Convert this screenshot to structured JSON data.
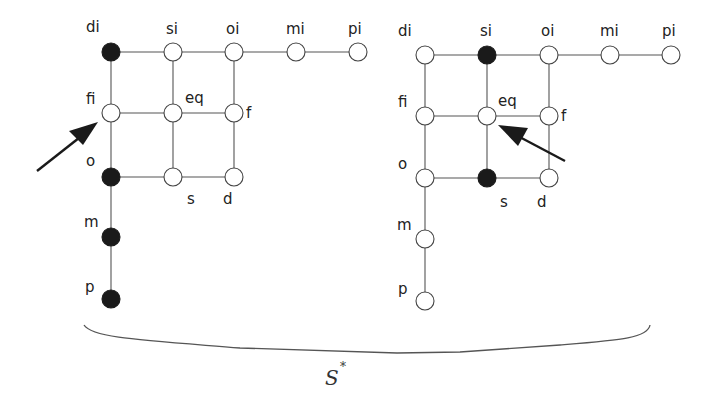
{
  "figure": {
    "caption_main": "S",
    "caption_sup": "*"
  },
  "diagrams": [
    {
      "id": "left",
      "nodes": {
        "di": {
          "label": "di",
          "filled": true
        },
        "si": {
          "label": "si",
          "filled": false
        },
        "oi": {
          "label": "oi",
          "filled": false
        },
        "mi": {
          "label": "mi",
          "filled": false
        },
        "pi": {
          "label": "pi",
          "filled": false
        },
        "fi": {
          "label": "fi",
          "filled": false
        },
        "eq": {
          "label": "eq",
          "filled": false
        },
        "f": {
          "label": "f",
          "filled": false
        },
        "o": {
          "label": "o",
          "filled": true
        },
        "s": {
          "label": "s",
          "filled": false
        },
        "d": {
          "label": "d",
          "filled": false
        },
        "m": {
          "label": "m",
          "filled": true
        },
        "p": {
          "label": "p",
          "filled": true
        }
      },
      "arrow_target": "fi"
    },
    {
      "id": "right",
      "nodes": {
        "di": {
          "label": "di",
          "filled": false
        },
        "si": {
          "label": "si",
          "filled": true
        },
        "oi": {
          "label": "oi",
          "filled": false
        },
        "mi": {
          "label": "mi",
          "filled": false
        },
        "pi": {
          "label": "pi",
          "filled": false
        },
        "fi": {
          "label": "fi",
          "filled": false
        },
        "eq": {
          "label": "eq",
          "filled": false
        },
        "f": {
          "label": "f",
          "filled": false
        },
        "o": {
          "label": "o",
          "filled": false
        },
        "s": {
          "label": "s",
          "filled": true
        },
        "d": {
          "label": "d",
          "filled": false
        },
        "m": {
          "label": "m",
          "filled": false
        },
        "p": {
          "label": "p",
          "filled": false
        }
      },
      "arrow_target": "eq"
    }
  ],
  "edges": [
    [
      "di",
      "si"
    ],
    [
      "si",
      "oi"
    ],
    [
      "oi",
      "mi"
    ],
    [
      "mi",
      "pi"
    ],
    [
      "fi",
      "eq"
    ],
    [
      "eq",
      "f"
    ],
    [
      "o",
      "s"
    ],
    [
      "s",
      "d"
    ],
    [
      "di",
      "fi"
    ],
    [
      "fi",
      "o"
    ],
    [
      "o",
      "m"
    ],
    [
      "m",
      "p"
    ],
    [
      "si",
      "eq"
    ],
    [
      "eq",
      "s"
    ],
    [
      "oi",
      "f"
    ],
    [
      "f",
      "d"
    ]
  ]
}
